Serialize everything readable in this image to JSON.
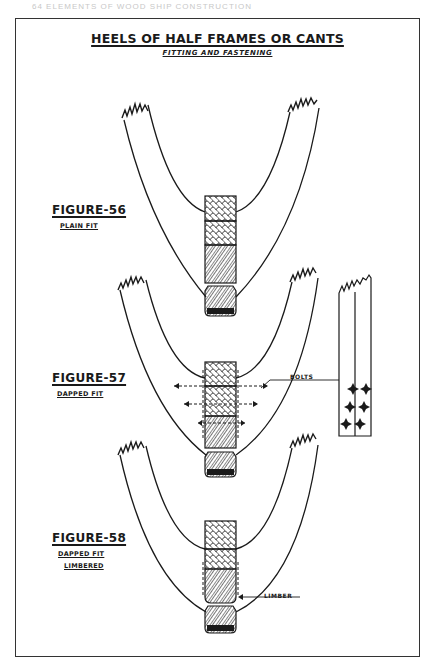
{
  "page": {
    "running_head": "64   ELEMENTS OF WOOD SHIP CONSTRUCTION"
  },
  "plate": {
    "title": "HEELS OF HALF FRAMES OR CANTS",
    "subtitle": "FITTING AND FASTENING",
    "figures": [
      {
        "label": "FIGURE-56",
        "caption_lines": [
          "PLAIN FIT"
        ]
      },
      {
        "label": "FIGURE-57",
        "caption_lines": [
          "DAPPED FIT"
        ],
        "callout": "BOLTS"
      },
      {
        "label": "FIGURE-58",
        "caption_lines": [
          "DAPPED FIT",
          "LIMBERED"
        ],
        "callout": "LIMBER"
      }
    ]
  },
  "colors": {
    "ink": "#1a1a1a",
    "paper": "#ffffff",
    "frame": "#333333"
  }
}
